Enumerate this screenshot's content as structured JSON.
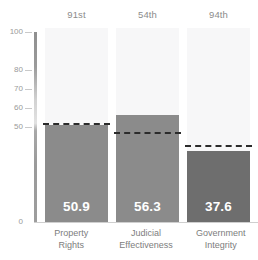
{
  "chart_data": {
    "type": "bar",
    "title": "",
    "subtitle": "",
    "xlabel": "",
    "ylabel": "",
    "ylim": [
      0,
      100
    ],
    "grid": false,
    "legend": "none",
    "categories": [
      "Property Rights",
      "Judicial Effectiveness",
      "Government Integrity"
    ],
    "values": [
      50.9,
      56.3,
      37.6
    ],
    "value_labels": [
      "50.9",
      "56.3",
      "37.6"
    ],
    "ranks": [
      "91st",
      "54th",
      "94th"
    ],
    "reference_lines": [
      52.0,
      47.5,
      40.5
    ],
    "reference_line_style": "dashed",
    "ytick_values": [
      100,
      80,
      70,
      60,
      50,
      0
    ],
    "ytick_labels": [
      "100",
      "80",
      "70",
      "60",
      "50",
      "0"
    ],
    "series": [
      {
        "name": "Score",
        "values": [
          50.9,
          56.3,
          37.6
        ]
      },
      {
        "name": "World Average",
        "values": [
          52.0,
          47.5,
          40.5
        ]
      }
    ],
    "bar_colors": [
      "#8b8b8b",
      "#8b8b8b",
      "#6e6e6e"
    ],
    "column_background": "#f7f7f8",
    "reference_color": "#2b2b2b"
  },
  "axis": {
    "ticks": [
      {
        "label": "100",
        "value": 100
      },
      {
        "label": "80",
        "value": 80
      },
      {
        "label": "70",
        "value": 70
      },
      {
        "label": "60",
        "value": 60
      },
      {
        "label": "50",
        "value": 50
      },
      {
        "label": "0",
        "value": 0
      }
    ]
  },
  "columns": [
    {
      "rank": "91st",
      "category_line1": "Property",
      "category_line2": "Rights",
      "value_label": "50.9",
      "value": 50.9,
      "reference": 52.0,
      "color": "#8b8b8b"
    },
    {
      "rank": "54th",
      "category_line1": "Judicial",
      "category_line2": "Effectiveness",
      "value_label": "56.3",
      "value": 56.3,
      "reference": 47.5,
      "color": "#8b8b8b"
    },
    {
      "rank": "94th",
      "category_line1": "Government",
      "category_line2": "Integrity",
      "value_label": "37.6",
      "value": 37.6,
      "reference": 40.5,
      "color": "#6e6e6e"
    }
  ]
}
